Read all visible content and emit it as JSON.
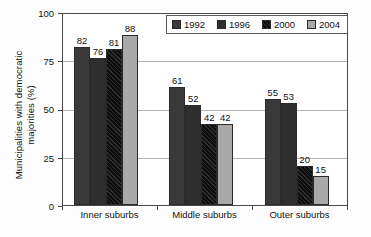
{
  "chart_data": {
    "type": "bar",
    "title": "",
    "xlabel": "",
    "ylabel": "Municipalities with democratic\nmajorities (%)",
    "ylim": [
      0,
      100
    ],
    "yticks": [
      "0",
      "25",
      "50",
      "75",
      "100"
    ],
    "grid": true,
    "legend_position": "top-right",
    "categories": [
      "Inner suburbs",
      "Middle suburbs",
      "Outer suburbs"
    ],
    "series": [
      {
        "name": "1992",
        "color": "#3a3a3a",
        "pattern": "solid",
        "values": [
          82,
          61,
          55
        ]
      },
      {
        "name": "1996",
        "color": "#2e2e2e",
        "pattern": "solid",
        "values": [
          76,
          52,
          53
        ]
      },
      {
        "name": "2000",
        "color": "#0d0d0d",
        "pattern": "diagonal-hatch",
        "values": [
          81,
          42,
          20
        ]
      },
      {
        "name": "2004",
        "color": "#a9a9a9",
        "pattern": "solid",
        "values": [
          88,
          42,
          15
        ]
      }
    ],
    "data_labels": [
      [
        "82",
        "76",
        "81",
        "88"
      ],
      [
        "61",
        "52",
        "42",
        "42"
      ],
      [
        "55",
        "53",
        "20",
        "15"
      ]
    ]
  },
  "legend": {
    "items": [
      {
        "label": "1992"
      },
      {
        "label": "1996"
      },
      {
        "label": "2000"
      },
      {
        "label": "2004"
      }
    ]
  }
}
